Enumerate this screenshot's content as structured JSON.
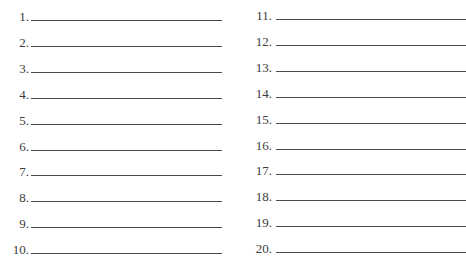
{
  "form": {
    "left_column": [
      {
        "number": "1.",
        "value": ""
      },
      {
        "number": "2.",
        "value": ""
      },
      {
        "number": "3.",
        "value": ""
      },
      {
        "number": "4.",
        "value": ""
      },
      {
        "number": "5.",
        "value": ""
      },
      {
        "number": "6.",
        "value": ""
      },
      {
        "number": "7.",
        "value": ""
      },
      {
        "number": "8.",
        "value": ""
      },
      {
        "number": "9.",
        "value": ""
      },
      {
        "number": "10.",
        "value": ""
      }
    ],
    "right_column": [
      {
        "number": "11.",
        "value": ""
      },
      {
        "number": "12.",
        "value": ""
      },
      {
        "number": "13.",
        "value": ""
      },
      {
        "number": "14.",
        "value": ""
      },
      {
        "number": "15.",
        "value": ""
      },
      {
        "number": "16.",
        "value": ""
      },
      {
        "number": "17.",
        "value": ""
      },
      {
        "number": "18.",
        "value": ""
      },
      {
        "number": "19.",
        "value": ""
      },
      {
        "number": "20.",
        "value": ""
      }
    ]
  }
}
